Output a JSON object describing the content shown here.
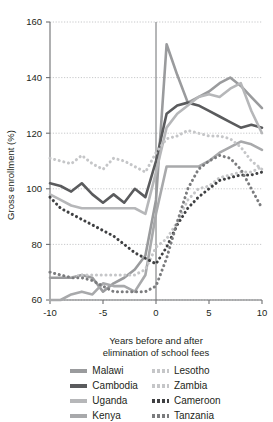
{
  "chart_data": {
    "type": "line",
    "title": "",
    "xlabel": "Years before and after elimination of school fees",
    "ylabel": "Gross enrollment (%)",
    "xlim": [
      -10,
      10
    ],
    "ylim": [
      60,
      160
    ],
    "x_ticks": [
      -10,
      -5,
      0,
      5,
      10
    ],
    "x_tick_labels": [
      "-10",
      "-5",
      "0",
      "5",
      "10"
    ],
    "y_ticks": [
      60,
      80,
      100,
      120,
      140,
      160
    ],
    "y_tick_labels": [
      "60",
      "80",
      "100",
      "120",
      "140",
      "160"
    ],
    "grid": "horizontal-dotted",
    "legend_position": "bottom",
    "reference_line_x": 0,
    "x": [
      -10,
      -9,
      -8,
      -7,
      -6,
      -5,
      -4,
      -3,
      -2,
      -1,
      0,
      1,
      2,
      3,
      4,
      5,
      6,
      7,
      8,
      9,
      10
    ],
    "series": [
      {
        "name": "Malawi",
        "style": "solid",
        "color": "#9a9b9d",
        "width": 2.6,
        "values": [
          68,
          68,
          68,
          69,
          68,
          63,
          66,
          68,
          71,
          76,
          96,
          152,
          141,
          131,
          133,
          135,
          138,
          140,
          137,
          133,
          129
        ]
      },
      {
        "name": "Cambodia",
        "style": "solid",
        "color": "#5a5b5d",
        "width": 2.6,
        "values": [
          102,
          101,
          99,
          102,
          98,
          95,
          98,
          95,
          100,
          97,
          110,
          127,
          130,
          131,
          130,
          128,
          126,
          124,
          122,
          123,
          122
        ]
      },
      {
        "name": "Uganda",
        "style": "solid",
        "color": "#b6b7b9",
        "width": 2.6,
        "values": [
          98,
          96,
          94,
          93,
          93,
          93,
          93,
          93,
          93,
          91,
          106,
          122,
          127,
          130,
          133,
          134,
          133,
          136,
          138,
          128,
          120
        ]
      },
      {
        "name": "Kenya",
        "style": "solid",
        "color": "#a8a9ab",
        "width": 2.6,
        "values": [
          60,
          60,
          62,
          63,
          62,
          66,
          65,
          65,
          63,
          69,
          91,
          108,
          108,
          108,
          108,
          110,
          113,
          115,
          117,
          116,
          114
        ]
      },
      {
        "name": "Lesotho",
        "style": "dotted",
        "color": "#c5c6c8",
        "width": 3.0,
        "values": [
          111,
          110,
          109,
          112,
          109,
          107,
          111,
          110,
          108,
          106,
          113,
          118,
          119,
          121,
          120,
          119,
          119,
          118,
          115,
          110,
          107
        ]
      },
      {
        "name": "Zambia",
        "style": "dotted",
        "color": "#c5c6c8",
        "width": 3.0,
        "values": [
          70,
          69,
          68,
          69,
          69,
          69,
          69,
          69,
          69,
          71,
          79,
          82,
          88,
          96,
          100,
          101,
          104,
          105,
          106,
          106,
          108
        ]
      },
      {
        "name": "Cameroon",
        "style": "dotted",
        "color": "#3f4042",
        "width": 3.0,
        "values": [
          97,
          93,
          91,
          89,
          87,
          85,
          83,
          80,
          77,
          75,
          73,
          79,
          87,
          93,
          97,
          100,
          103,
          104,
          105,
          105,
          106
        ]
      },
      {
        "name": "Tanzania",
        "style": "dotted",
        "color": "#7b7c7e",
        "width": 3.0,
        "values": [
          70,
          69,
          68,
          68,
          67,
          65,
          63,
          63,
          63,
          63,
          65,
          75,
          88,
          100,
          107,
          110,
          112,
          111,
          107,
          100,
          93
        ]
      }
    ]
  },
  "legend": {
    "left_column": [
      {
        "label": "Malawi",
        "series": "Malawi"
      },
      {
        "label": "Cambodia",
        "series": "Cambodia"
      },
      {
        "label": "Uganda",
        "series": "Uganda"
      },
      {
        "label": "Kenya",
        "series": "Kenya"
      }
    ],
    "right_column": [
      {
        "label": "Lesotho",
        "series": "Lesotho"
      },
      {
        "label": "Zambia",
        "series": "Zambia"
      },
      {
        "label": "Cameroon",
        "series": "Cameroon"
      },
      {
        "label": "Tanzania",
        "series": "Tanzania"
      }
    ]
  },
  "xlabel_lines": [
    "Years before and after",
    "elimination of school fees"
  ]
}
